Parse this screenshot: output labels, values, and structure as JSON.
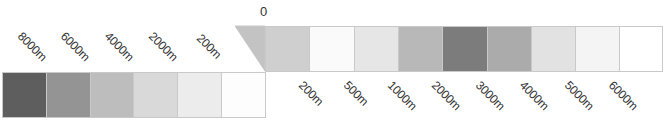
{
  "legend": {
    "zero_label": "0",
    "depth_scale": {
      "description": "Ocean depth bands (left bar, deepest to shallowest)",
      "cells": [
        {
          "label": "8000m",
          "color": "#5e5e5e"
        },
        {
          "label": "6000m",
          "color": "#949494"
        },
        {
          "label": "4000m",
          "color": "#bdbdbd"
        },
        {
          "label": "2000m",
          "color": "#d9d9d9"
        },
        {
          "label": "200m",
          "color": "#ececec"
        },
        {
          "label": "",
          "color": "#fdfdfd"
        }
      ]
    },
    "elevation_scale": {
      "description": "Land elevation bands (right bar)",
      "wedge_color": "#c3c3c3",
      "cells": [
        {
          "label": "200m",
          "color": "#cfcfcf"
        },
        {
          "label": "500m",
          "color": "#fafafa"
        },
        {
          "label": "1000m",
          "color": "#e6e6e6"
        },
        {
          "label": "2000m",
          "color": "#b8b8b8"
        },
        {
          "label": "3000m",
          "color": "#7c7c7c"
        },
        {
          "label": "4000m",
          "color": "#ababab"
        },
        {
          "label": "5000m",
          "color": "#e2e2e2"
        },
        {
          "label": "6000m",
          "color": "#f4f4f4"
        },
        {
          "label": "",
          "color": "#ffffff"
        }
      ]
    }
  }
}
